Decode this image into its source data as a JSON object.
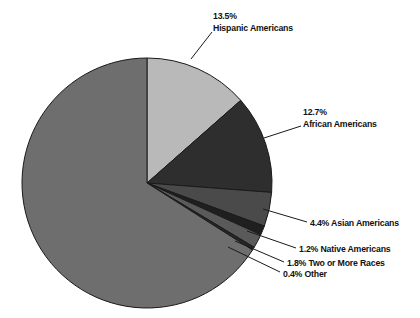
{
  "chart_data": {
    "type": "pie",
    "title": "",
    "subtitle": "",
    "xlabel": "",
    "ylabel": "",
    "legend_position": "callout-labels",
    "grid": false,
    "units": "percent",
    "categories": [
      "White Americans",
      "Hispanic Americans",
      "African Americans",
      "Asian Americans",
      "Native Americans",
      "Two or More Races",
      "Other"
    ],
    "values": [
      66.0,
      13.5,
      12.7,
      4.4,
      1.2,
      1.8,
      0.4
    ],
    "slices": [
      {
        "name": "Hispanic Americans",
        "label": "Hispanic Americans",
        "percent": 13.5,
        "percent_text": "13.5%",
        "color": "#b9b9b9",
        "labeled": true
      },
      {
        "name": "African Americans",
        "label": "African Americans",
        "percent": 12.7,
        "percent_text": "12.7%",
        "color": "#2e2e2e",
        "labeled": true
      },
      {
        "name": "Asian Americans",
        "label": "4.4% Asian Americans",
        "percent": 4.4,
        "percent_text": "4.4%",
        "color": "#4a4a4a",
        "labeled": true
      },
      {
        "name": "Native Americans",
        "label": "1.2% Native Americans",
        "percent": 1.2,
        "percent_text": "1.2%",
        "color": "#1f1f1f",
        "labeled": true
      },
      {
        "name": "Two or More Races",
        "label": "1.8% Two or More Races",
        "percent": 1.8,
        "percent_text": "1.8%",
        "color": "#5a5a5a",
        "labeled": true
      },
      {
        "name": "Other",
        "label": "0.4% Other",
        "percent": 0.4,
        "percent_text": "0.4%",
        "color": "#262626",
        "labeled": true
      },
      {
        "name": "White Americans",
        "label": "",
        "percent": 66.0,
        "percent_text": "",
        "color": "#6e6e6e",
        "labeled": false
      }
    ],
    "colors": {
      "background": "#ffffff",
      "outline": "#1a1a1a",
      "leader_line": "#1a1a1a",
      "text": "#111111"
    }
  },
  "labels": {
    "hispanic": {
      "percent": "13.5%",
      "name": "Hispanic Americans"
    },
    "african": {
      "percent": "12.7%",
      "name": "African Americans"
    },
    "asian": {
      "text": "4.4% Asian Americans"
    },
    "native": {
      "text": "1.2% Native Americans"
    },
    "two_or_more": {
      "text": "1.8% Two or More Races"
    },
    "other": {
      "text": "0.4% Other"
    }
  }
}
